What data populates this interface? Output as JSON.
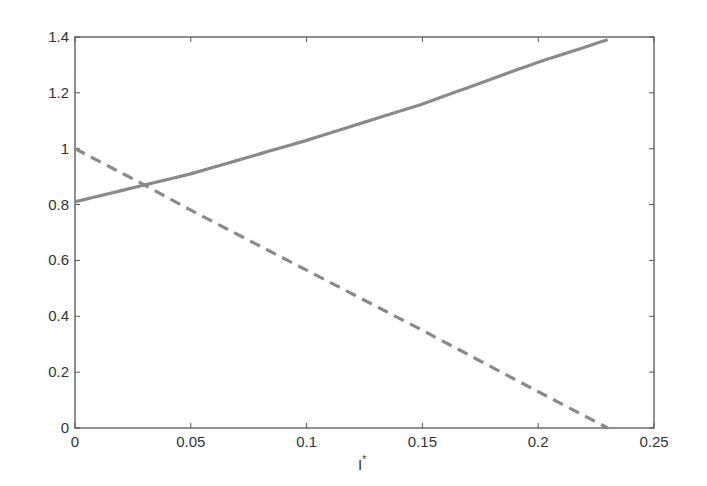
{
  "chart_data": {
    "type": "line",
    "title": "",
    "xlabel": "I*",
    "ylabel": "",
    "xlim": [
      0,
      0.25
    ],
    "ylim": [
      0,
      1.4
    ],
    "xticks": [
      "0",
      "0.05",
      "0.1",
      "0.15",
      "0.2",
      "0.25"
    ],
    "yticks": [
      "0",
      "0.2",
      "0.4",
      "0.6",
      "0.8",
      "1",
      "1.2",
      "1.4"
    ],
    "grid": false,
    "legend": null,
    "series": [
      {
        "name": "solid",
        "style": "solid",
        "color": "#8a8a8a",
        "x": [
          0,
          0.03,
          0.05,
          0.1,
          0.15,
          0.2,
          0.23
        ],
        "y": [
          0.81,
          0.87,
          0.91,
          1.03,
          1.16,
          1.31,
          1.39
        ]
      },
      {
        "name": "dashed",
        "style": "dashed",
        "color": "#8a8a8a",
        "x": [
          0,
          0.03,
          0.05,
          0.1,
          0.15,
          0.2,
          0.23
        ],
        "y": [
          1.0,
          0.87,
          0.78,
          0.565,
          0.35,
          0.13,
          0.0
        ]
      }
    ]
  },
  "labels": {
    "xlabel_main": "I",
    "xlabel_sup": "*"
  }
}
